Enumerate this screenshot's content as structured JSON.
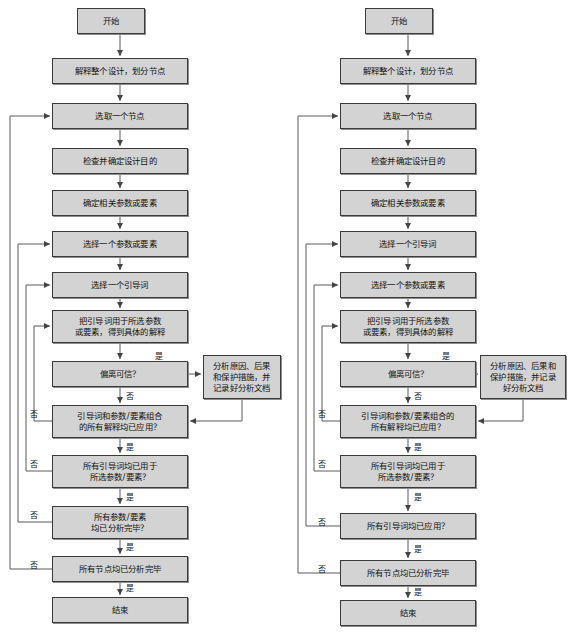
{
  "page": {
    "background_color": "#ffffff",
    "node_fill_color": "#d3d3d3",
    "node_border_color": "#3a3a3a",
    "line_color": "#5a5a5a"
  },
  "labels": {
    "yes": "是",
    "no": "否"
  },
  "charts": [
    {
      "id": "chart-left",
      "name": "flowchart-left",
      "nodes": [
        {
          "id": "l-start",
          "text": "开始",
          "x": 77,
          "y": 8,
          "w": 68,
          "h": 26
        },
        {
          "id": "l-n1",
          "text": "解释整个设计，划分节点",
          "x": 52,
          "y": 58,
          "w": 136,
          "h": 26
        },
        {
          "id": "l-n2",
          "text": "选取一个节点",
          "x": 52,
          "y": 103,
          "w": 136,
          "h": 26
        },
        {
          "id": "l-n3",
          "text": "检查并确定设计目的",
          "x": 52,
          "y": 148,
          "w": 136,
          "h": 26
        },
        {
          "id": "l-n4",
          "text": "确定相关参数或要素",
          "x": 52,
          "y": 190,
          "w": 136,
          "h": 26
        },
        {
          "id": "l-n5",
          "text": "选择一个参数或要素",
          "x": 52,
          "y": 231,
          "w": 136,
          "h": 26
        },
        {
          "id": "l-n6",
          "text": "选择一个引导词",
          "x": 52,
          "y": 272,
          "w": 136,
          "h": 26
        },
        {
          "id": "l-n7",
          "text": "把引导词用于所选参数\n或要素，得到具体的解释",
          "x": 52,
          "y": 310,
          "w": 136,
          "h": 33
        },
        {
          "id": "l-n8",
          "text": "偏离可信？",
          "x": 52,
          "y": 361,
          "w": 136,
          "h": 26
        },
        {
          "id": "l-side",
          "text": "分析原因、后果\n和保护措施，并\n记录好分析文档",
          "x": 203,
          "y": 355,
          "w": 78,
          "h": 44
        },
        {
          "id": "l-n9",
          "text": "引导词和参数/要素组合\n的所有解释均已应用？",
          "x": 52,
          "y": 405,
          "w": 136,
          "h": 33
        },
        {
          "id": "l-n10",
          "text": "所有引导词均已用于\n所选参数/要素？",
          "x": 52,
          "y": 455,
          "w": 136,
          "h": 33
        },
        {
          "id": "l-n11",
          "text": "所有参数/要素\n均已分析完毕？",
          "x": 52,
          "y": 506,
          "w": 136,
          "h": 33
        },
        {
          "id": "l-n12",
          "text": "所有节点均已分析完毕",
          "x": 52,
          "y": 556,
          "w": 136,
          "h": 26
        },
        {
          "id": "l-end",
          "text": "结束",
          "x": 52,
          "y": 597,
          "w": 136,
          "h": 26
        }
      ],
      "edge_labels": [
        {
          "text": "是",
          "x": 155,
          "y": 352
        },
        {
          "text": "否",
          "x": 126,
          "y": 392
        },
        {
          "text": "否",
          "x": 30,
          "y": 410
        },
        {
          "text": "是",
          "x": 126,
          "y": 443
        },
        {
          "text": "否",
          "x": 30,
          "y": 460
        },
        {
          "text": "是",
          "x": 126,
          "y": 493
        },
        {
          "text": "否",
          "x": 30,
          "y": 511
        },
        {
          "text": "是",
          "x": 126,
          "y": 543
        },
        {
          "text": "否",
          "x": 30,
          "y": 561
        },
        {
          "text": "是",
          "x": 126,
          "y": 584
        }
      ]
    },
    {
      "id": "chart-right",
      "name": "flowchart-right",
      "nodes": [
        {
          "id": "r-start",
          "text": "开始",
          "x": 75,
          "y": 8,
          "w": 68,
          "h": 26
        },
        {
          "id": "r-n1",
          "text": "解释整个设计，划分节点",
          "x": 50,
          "y": 58,
          "w": 136,
          "h": 26
        },
        {
          "id": "r-n2",
          "text": "选取一个节点",
          "x": 50,
          "y": 103,
          "w": 136,
          "h": 26
        },
        {
          "id": "r-n3",
          "text": "检查并确定设计目的",
          "x": 50,
          "y": 148,
          "w": 136,
          "h": 26
        },
        {
          "id": "r-n4",
          "text": "确定相关参数或要素",
          "x": 50,
          "y": 190,
          "w": 136,
          "h": 26
        },
        {
          "id": "r-n5",
          "text": "选择一个引导词",
          "x": 50,
          "y": 231,
          "w": 136,
          "h": 26
        },
        {
          "id": "r-n6",
          "text": "选择一个参数或要素",
          "x": 50,
          "y": 272,
          "w": 136,
          "h": 26
        },
        {
          "id": "r-n7",
          "text": "把引导词用于所选参数\n或要素，得到具体的解释",
          "x": 50,
          "y": 310,
          "w": 136,
          "h": 33
        },
        {
          "id": "r-n8",
          "text": "偏离可信？",
          "x": 50,
          "y": 361,
          "w": 136,
          "h": 26
        },
        {
          "id": "r-side",
          "text": "分析原因、后果和\n保护措施，并记录\n好分析文档",
          "x": 190,
          "y": 355,
          "w": 86,
          "h": 44
        },
        {
          "id": "r-n9",
          "text": "引导词和参数/要素组合的\n所有解释均已应用？",
          "x": 50,
          "y": 405,
          "w": 136,
          "h": 33
        },
        {
          "id": "r-n10",
          "text": "所有引导词均已用于\n所选参数/要素？",
          "x": 50,
          "y": 455,
          "w": 136,
          "h": 33
        },
        {
          "id": "r-n11",
          "text": "所有引导词均已应用？",
          "x": 50,
          "y": 513,
          "w": 136,
          "h": 26
        },
        {
          "id": "r-n12",
          "text": "所有节点均已分析完毕",
          "x": 50,
          "y": 560,
          "w": 136,
          "h": 26
        },
        {
          "id": "r-end",
          "text": "结束",
          "x": 50,
          "y": 600,
          "w": 136,
          "h": 26
        }
      ],
      "edge_labels": [
        {
          "text": "是",
          "x": 152,
          "y": 352
        },
        {
          "text": "否",
          "x": 124,
          "y": 392
        },
        {
          "text": "否",
          "x": 28,
          "y": 410
        },
        {
          "text": "是",
          "x": 124,
          "y": 443
        },
        {
          "text": "否",
          "x": 28,
          "y": 460
        },
        {
          "text": "是",
          "x": 124,
          "y": 493
        },
        {
          "text": "否",
          "x": 28,
          "y": 518
        },
        {
          "text": "是",
          "x": 124,
          "y": 545
        },
        {
          "text": "否",
          "x": 28,
          "y": 565
        },
        {
          "text": "是",
          "x": 124,
          "y": 588
        }
      ]
    }
  ]
}
